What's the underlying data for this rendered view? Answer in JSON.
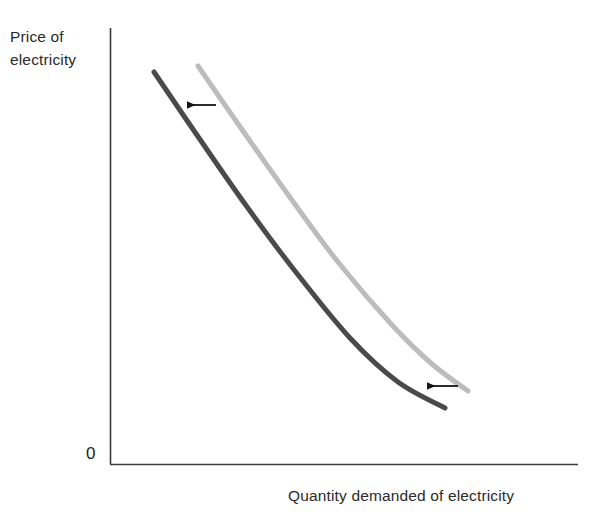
{
  "figure": {
    "type": "economics-demand-curve-shift",
    "caption_cropped": "",
    "origin_label": "0",
    "axes": {
      "y_label_line1": "Price of",
      "y_label_line2": "electricity",
      "x_label": "Quantity demanded of electricity"
    },
    "colors": {
      "axis": "#3a3a3a",
      "curve_shifted": "#4a4a4a",
      "curve_original": "#bcbcbc",
      "arrow": "#141414",
      "background": "#ffffff",
      "text": "#2b2b2b"
    }
  },
  "chart_data": {
    "type": "line",
    "title": "",
    "xlabel": "Quantity demanded of electricity",
    "ylabel": "Price of electricity",
    "grid": false,
    "legend": "none",
    "axis_ticks": {
      "x": [],
      "y": [],
      "origin": "0"
    },
    "axis_geometry": {
      "y_axis_x": 110,
      "y_axis_top": 28,
      "x_axis_y": 464,
      "x_axis_right": 578
    },
    "series": [
      {
        "name": "Original demand curve",
        "role": "original",
        "color": "#bcbcbc",
        "stroke_width": 5,
        "points": [
          [
            198,
            66
          ],
          [
            243,
            131
          ],
          [
            289,
            196
          ],
          [
            338,
            262
          ],
          [
            392,
            325
          ],
          [
            432,
            364
          ],
          [
            468,
            391
          ]
        ]
      },
      {
        "name": "Demand curve after leftward shift",
        "role": "shifted",
        "color": "#4a4a4a",
        "stroke_width": 5,
        "points": [
          [
            154,
            72
          ],
          [
            199,
            138
          ],
          [
            245,
            204
          ],
          [
            295,
            271
          ],
          [
            350,
            338
          ],
          [
            398,
            382
          ],
          [
            445,
            408
          ]
        ]
      }
    ],
    "annotations": [
      {
        "name": "shift-arrow-upper",
        "kind": "arrow",
        "direction": "left",
        "from": [
          216,
          105
        ],
        "to": [
          187,
          105
        ]
      },
      {
        "name": "shift-arrow-lower",
        "kind": "arrow",
        "direction": "left",
        "from": [
          458,
          386
        ],
        "to": [
          427,
          386
        ]
      }
    ]
  }
}
